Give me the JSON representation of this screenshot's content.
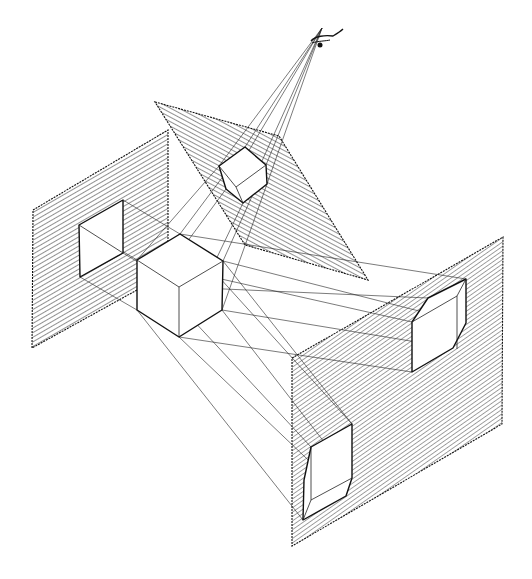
{
  "figure": {
    "title": "",
    "elements": {
      "eye": "observer-eye-icon",
      "object": "cube",
      "planes": [
        "top-projection-plane",
        "left-projection-plane",
        "right-projection-plane"
      ],
      "hatch_color": "#111111",
      "line_color": "#111111",
      "background": "#ffffff"
    },
    "labels": []
  }
}
